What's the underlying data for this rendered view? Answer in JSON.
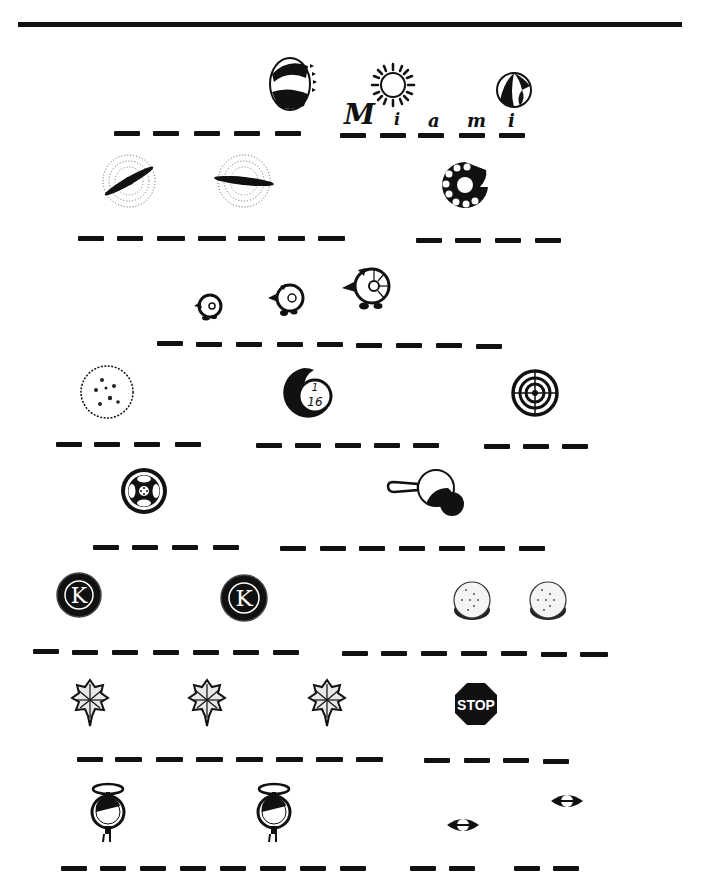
{
  "worksheet": {
    "title": "Picture puzzle worksheet",
    "rows": [
      {
        "id": 1,
        "icons": [
          "bottle-cap-icon",
          "sun-icon",
          "beach-ball-icon"
        ],
        "answer_groups": [
          {
            "blanks": 5,
            "letters": []
          },
          {
            "blanks": 5,
            "letters": [
              "M",
              "i",
              "a",
              "m",
              "i"
            ]
          }
        ],
        "written_word": "Miami"
      },
      {
        "id": 2,
        "icons": [
          "propeller-icon",
          "propeller-icon",
          "rotary-dial-icon"
        ],
        "answer_groups": [
          {
            "blanks": 7
          },
          {
            "blanks": 4
          }
        ]
      },
      {
        "id": 3,
        "icons": [
          "small-turtle-icon",
          "medium-turtle-icon",
          "large-turtle-icon"
        ],
        "answer_groups": [
          {
            "blanks": 9
          }
        ]
      },
      {
        "id": 4,
        "icons": [
          "cracker-icon",
          "billiard-ball-16-icon",
          "target-icon"
        ],
        "answer_groups": [
          {
            "blanks": 4
          },
          {
            "blanks": 5
          },
          {
            "blanks": 3
          }
        ],
        "ball_label": "1/16"
      },
      {
        "id": 5,
        "icons": [
          "film-reel-icon",
          "frying-pan-icon"
        ],
        "answer_groups": [
          {
            "blanks": 4
          },
          {
            "blanks": 7
          }
        ]
      },
      {
        "id": 6,
        "icons": [
          "kiwanis-k-icon",
          "kiwanis-k-icon",
          "coin-stack-icon",
          "coin-stack-icon"
        ],
        "answer_groups": [
          {
            "blanks": 7
          },
          {
            "blanks": 7
          }
        ],
        "badge_letter": "K"
      },
      {
        "id": 7,
        "icons": [
          "oak-leaf-icon",
          "oak-leaf-icon",
          "oak-leaf-icon",
          "stop-sign-icon"
        ],
        "answer_groups": [
          {
            "blanks": 8
          },
          {
            "blanks": 4
          }
        ],
        "sign_text": "STOP"
      },
      {
        "id": 8,
        "icons": [
          "pocket-watch-icon",
          "pocket-watch-icon",
          "eye-icon",
          "eye-icon"
        ],
        "answer_groups": [
          {
            "blanks": 8
          },
          {
            "blanks": 2
          },
          {
            "blanks": 2
          }
        ]
      }
    ]
  },
  "colors": {
    "ink": "#111111",
    "paper": "#ffffff"
  }
}
